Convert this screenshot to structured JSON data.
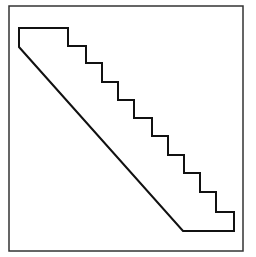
{
  "figure": {
    "stroke_color": "#111111",
    "frame_color": "#333333",
    "background": "#ffffff",
    "frame": {
      "x": 9,
      "y": 6,
      "width": 234,
      "height": 245
    },
    "staircase_points": "19,28 68,28 68,46 86,46 86,63 102,63 102,82 118,82 118,100 134,100 134,118 152,118 152,136 168,136 168,155 184,155 184,173 200,173 200,192 216,192 216,212 234,212 234,231 183,231 19,47",
    "step_count": 11
  }
}
